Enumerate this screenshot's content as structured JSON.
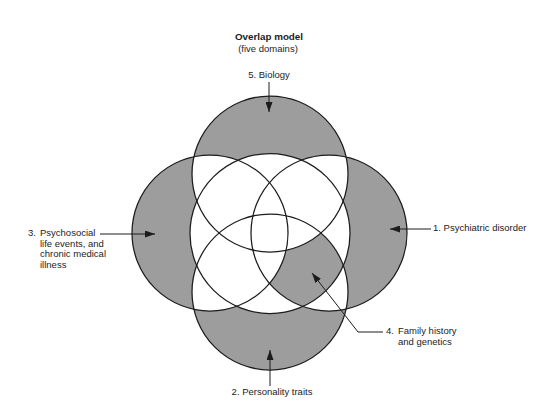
{
  "diagram": {
    "title": "Overlap model",
    "subtitle": "(five domains)",
    "colors": {
      "shade": "#9d9d9d",
      "outline": "#1c1c1c",
      "text": "#1c1c1c",
      "background": "#ffffff"
    },
    "domains": {
      "psychiatric": {
        "label": "1. Psychiatric disorder"
      },
      "personality": {
        "label": "2. Personality traits"
      },
      "psychosocial": {
        "number": "3.",
        "lines": [
          "Psychosocial",
          "life events, and",
          "chronic medical",
          "illness"
        ]
      },
      "family": {
        "number": "4.",
        "lines": [
          "Family history",
          "and genetics"
        ]
      },
      "biology": {
        "label": "5. Biology"
      }
    }
  }
}
